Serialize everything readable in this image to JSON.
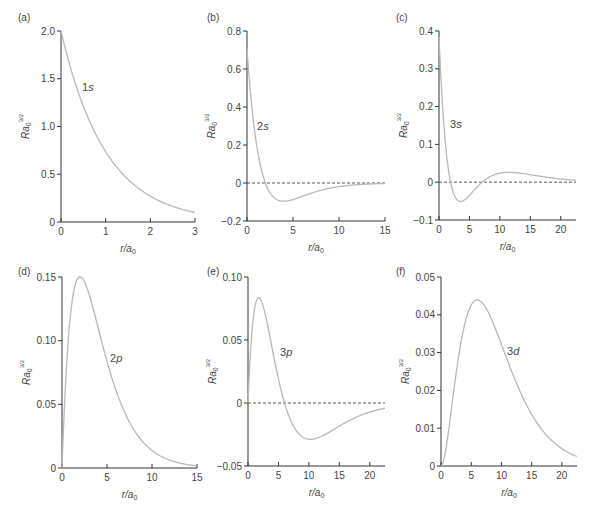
{
  "figure": {
    "layout": "2 rows x 3 columns"
  },
  "chart_data": [
    {
      "id": "a",
      "panel_label": "(a)",
      "type": "line",
      "curve_label": "1s",
      "xlabel": "r/a0",
      "ylabel": "Ra0^3/2",
      "xlim": [
        0,
        3
      ],
      "ylim": [
        0,
        2.0
      ],
      "xticks": [
        0,
        1,
        2,
        3
      ],
      "yticks": [
        0,
        0.5,
        1.0,
        1.5,
        2.0
      ],
      "ytick_labels": [
        "0",
        "0.5",
        "1.0",
        "1.5",
        "2.0"
      ],
      "zero_line": false,
      "x": [
        0,
        0.25,
        0.5,
        0.75,
        1,
        1.5,
        2,
        2.5,
        3
      ],
      "y": [
        2.0,
        1.558,
        1.213,
        0.945,
        0.736,
        0.446,
        0.271,
        0.164,
        0.1
      ]
    },
    {
      "id": "b",
      "panel_label": "(b)",
      "type": "line",
      "curve_label": "2s",
      "xlabel": "r/a0",
      "ylabel": "Ra0^3/2",
      "xlim": [
        0,
        15
      ],
      "ylim": [
        -0.2,
        0.8
      ],
      "xticks": [
        0,
        5,
        10,
        15
      ],
      "yticks": [
        -0.2,
        0,
        0.2,
        0.4,
        0.6,
        0.8
      ],
      "ytick_labels": [
        "-0.2",
        "0",
        "0.2",
        "0.4",
        "0.6",
        "0.8"
      ],
      "zero_line": true,
      "x": [
        0,
        1,
        2,
        3,
        4,
        5,
        6,
        8,
        10,
        12,
        15
      ],
      "y": [
        0.707,
        0.214,
        0,
        -0.079,
        -0.096,
        -0.087,
        -0.071,
        -0.039,
        -0.019,
        -0.009,
        -0.002
      ]
    },
    {
      "id": "c",
      "panel_label": "(c)",
      "type": "line",
      "curve_label": "3s",
      "xlabel": "r/a0",
      "ylabel": "Ra0^3/2",
      "xlim": [
        0,
        22.5
      ],
      "ylim": [
        -0.1,
        0.4
      ],
      "xticks": [
        0,
        5,
        10,
        15,
        20
      ],
      "yticks": [
        -0.1,
        0,
        0.1,
        0.2,
        0.3,
        0.4
      ],
      "ytick_labels": [
        "-0.1",
        "0",
        "0.1",
        "0.2",
        "0.3",
        "0.4"
      ],
      "zero_line": true,
      "x": [
        0,
        1,
        2,
        3,
        4,
        5,
        7,
        9,
        11,
        13,
        16,
        20,
        22.5
      ],
      "y": [
        0.385,
        0.156,
        0.014,
        -0.04,
        -0.05,
        -0.039,
        0.001,
        0.02,
        0.024,
        0.022,
        0.017,
        0.01,
        0.008
      ]
    },
    {
      "id": "d",
      "panel_label": "(d)",
      "type": "line",
      "curve_label": "2p",
      "xlabel": "r/a0",
      "ylabel": "Ra0^3/2",
      "xlim": [
        0,
        15
      ],
      "ylim": [
        0,
        0.15
      ],
      "xticks": [
        0,
        5,
        10,
        15
      ],
      "yticks": [
        0,
        0.05,
        0.1,
        0.15
      ],
      "ytick_labels": [
        "0",
        "0.05",
        "0.10",
        "0.15"
      ],
      "zero_line": false,
      "x": [
        0,
        1,
        2,
        3,
        4,
        5,
        6,
        8,
        10,
        12,
        15
      ],
      "y": [
        0,
        0.124,
        0.15,
        0.137,
        0.11,
        0.084,
        0.061,
        0.03,
        0.014,
        0.006,
        0.002
      ]
    },
    {
      "id": "e",
      "panel_label": "(e)",
      "type": "line",
      "curve_label": "3p",
      "xlabel": "r/a0",
      "ylabel": "Ra0^3/2",
      "xlim": [
        0,
        22.5
      ],
      "ylim": [
        -0.05,
        0.1
      ],
      "xticks": [
        0,
        5,
        10,
        15,
        20
      ],
      "yticks": [
        -0.05,
        0,
        0.05,
        0.1
      ],
      "ytick_labels": [
        "-0.05",
        "0",
        "0.05",
        "0.10"
      ],
      "zero_line": true,
      "x": [
        0,
        1,
        2,
        3,
        4,
        5,
        6,
        8,
        10,
        12,
        15,
        20,
        22.5
      ],
      "y": [
        0,
        0.072,
        0.078,
        0.06,
        0.037,
        0.016,
        0,
        -0.017,
        -0.02,
        -0.018,
        -0.012,
        -0.005,
        -0.003
      ]
    },
    {
      "id": "f",
      "panel_label": "(f)",
      "type": "line",
      "curve_label": "3d",
      "xlabel": "r/a0",
      "ylabel": "Ra0^3/2",
      "xlim": [
        0,
        22.5
      ],
      "ylim": [
        0,
        0.05
      ],
      "xticks": [
        0,
        5,
        10,
        15,
        20
      ],
      "yticks": [
        0,
        0.01,
        0.02,
        0.03,
        0.04,
        0.05
      ],
      "ytick_labels": [
        "0",
        "0.01",
        "0.02",
        "0.03",
        "0.04",
        "0.05"
      ],
      "zero_line": false,
      "x": [
        0,
        1,
        2,
        3,
        4,
        5,
        6,
        7,
        8,
        10,
        12,
        15,
        18,
        20,
        22.5
      ],
      "y": [
        0,
        0.0064,
        0.0202,
        0.0341,
        0.0432,
        0.0468,
        0.0458,
        0.0417,
        0.0359,
        0.0241,
        0.0149,
        0.0066,
        0.0027,
        0.0015,
        0.0008
      ]
    }
  ]
}
